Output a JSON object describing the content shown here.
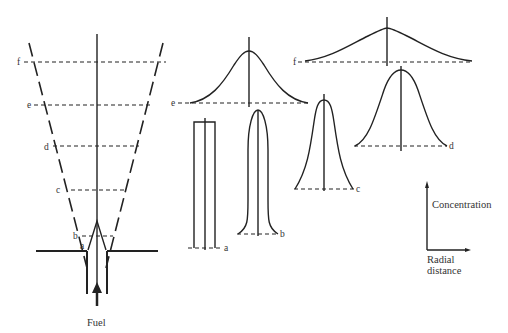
{
  "diagram": {
    "title": "",
    "nozzle": {
      "fuel_label": "Fuel",
      "station_labels": [
        "a",
        "b",
        "c",
        "d",
        "e",
        "f"
      ]
    },
    "profiles": [
      {
        "station": "a",
        "label": "a",
        "shape": "top-hat"
      },
      {
        "station": "b",
        "label": "b",
        "shape": "rounded-top-hat"
      },
      {
        "station": "c",
        "label": "c",
        "shape": "peaked"
      },
      {
        "station": "d",
        "label": "d",
        "shape": "gaussian-narrow"
      },
      {
        "station": "e",
        "label": "e",
        "shape": "gaussian-medium"
      },
      {
        "station": "f",
        "label": "f",
        "shape": "gaussian-wide"
      }
    ],
    "axes_key": {
      "y_label": "Concentration",
      "x_label_line1": "Radial",
      "x_label_line2": "distance"
    },
    "colors": {
      "ink": "#222222",
      "label": "#333333",
      "background": "#ffffff"
    }
  }
}
